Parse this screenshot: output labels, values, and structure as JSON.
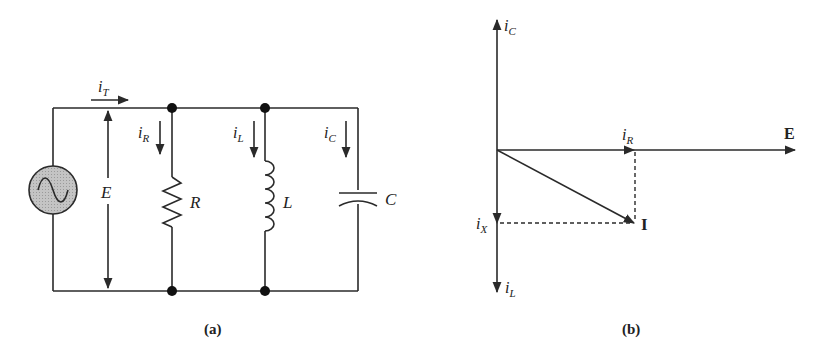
{
  "figure": {
    "panel_a": {
      "caption": "(a)",
      "title": "Parallel RLC circuit",
      "source": {
        "type": "AC voltage source",
        "icon": "sine-wave-icon",
        "fill_color": "#bdbdbd"
      },
      "voltage_label": "E",
      "total_current": {
        "symbol": "i",
        "subscript": "T"
      },
      "branches": [
        {
          "component": "resistor",
          "label": "R",
          "current_symbol": "i",
          "current_subscript": "R"
        },
        {
          "component": "inductor",
          "label": "L",
          "current_symbol": "i",
          "current_subscript": "L"
        },
        {
          "component": "capacitor",
          "label": "C",
          "current_symbol": "i",
          "current_subscript": "C"
        }
      ]
    },
    "panel_b": {
      "caption": "(b)",
      "title": "Phasor diagram",
      "vectors": {
        "E": "E",
        "I": "I",
        "iR": {
          "symbol": "i",
          "subscript": "R"
        },
        "iC": {
          "symbol": "i",
          "subscript": "C"
        },
        "iL": {
          "symbol": "i",
          "subscript": "L"
        },
        "iX": {
          "symbol": "i",
          "subscript": "X"
        }
      }
    }
  }
}
